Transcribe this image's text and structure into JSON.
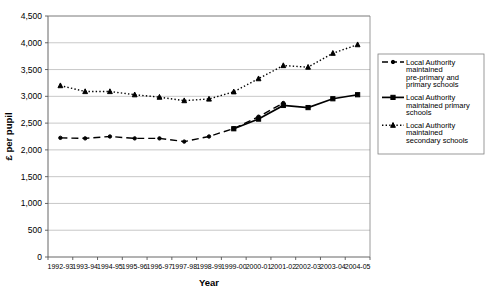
{
  "chart_data": {
    "type": "line",
    "title": "",
    "xlabel": "Year",
    "ylabel": "£ per pupil",
    "ylim": [
      0,
      4500
    ],
    "ytick_step": 500,
    "grid": true,
    "legend_position": "right",
    "categories": [
      "1992-93",
      "1993-94",
      "1994-95",
      "1995-96",
      "1996-97",
      "1997-98",
      "1998-99",
      "1999-00",
      "2000-01",
      "2001-02",
      "2002-03",
      "2003-04",
      "2004-05"
    ],
    "ytick_labels": [
      "0",
      "500",
      "1,000",
      "1,500",
      "2,000",
      "2,500",
      "3,000",
      "3,500",
      "4,000",
      "4,500"
    ],
    "ytick_values": [
      0,
      500,
      1000,
      1500,
      2000,
      2500,
      3000,
      3500,
      4000,
      4500
    ],
    "series": [
      {
        "name": "Local Authority maintained pre-primary and primary schools",
        "marker": "circle",
        "line_style": "dashed",
        "color": "#000000",
        "values": [
          2225,
          2215,
          2250,
          2215,
          2215,
          2155,
          2250,
          2400,
          2620,
          2875,
          null,
          null,
          null
        ]
      },
      {
        "name": "Local Authority maintained primary schools",
        "marker": "square",
        "line_style": "solid",
        "color": "#000000",
        "values": [
          null,
          null,
          null,
          null,
          null,
          null,
          null,
          2395,
          2575,
          2830,
          2790,
          2955,
          3030
        ]
      },
      {
        "name": "Local Authority maintained secondary schools",
        "marker": "triangle",
        "line_style": "dotted",
        "color": "#000000",
        "values": [
          3200,
          3090,
          3090,
          3030,
          2985,
          2920,
          2950,
          3085,
          3330,
          3575,
          3545,
          3805,
          3965
        ]
      }
    ]
  },
  "legend": {
    "items": [
      {
        "label": "Local Authority maintained pre-primary and primary schools",
        "marker": "circle",
        "line_style": "dashed"
      },
      {
        "label": "Local Authority maintained primary schools",
        "marker": "square",
        "line_style": "solid"
      },
      {
        "label": "Local Authority maintained secondary schools",
        "marker": "triangle",
        "line_style": "dotted"
      }
    ]
  }
}
